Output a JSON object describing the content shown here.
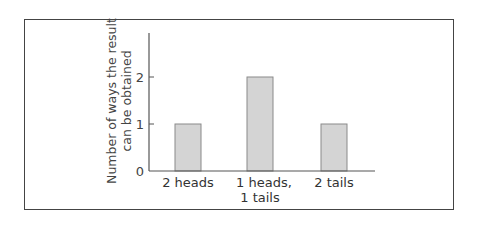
{
  "chart_data": {
    "type": "bar",
    "title": "",
    "categories": [
      "2 heads",
      "1 heads, 1 tails",
      "2 tails"
    ],
    "category_lines": [
      [
        "2 heads"
      ],
      [
        "1 heads,",
        "1 tails"
      ],
      [
        "2 tails"
      ]
    ],
    "values": [
      1,
      2,
      1
    ],
    "xlabel": "",
    "ylabel": "Number of ways the result can be obtained",
    "ylabel_lines": [
      "Number of ways the result",
      "can be obtained"
    ],
    "yticks": [
      "0",
      "1",
      "2"
    ],
    "ylim": [
      0,
      3
    ],
    "grid": false,
    "legend": null,
    "colors": {
      "bar_fill": "#d4d4d4",
      "bar_stroke": "#8a8a8a",
      "axis": "#555555",
      "frame": "#444444"
    }
  }
}
